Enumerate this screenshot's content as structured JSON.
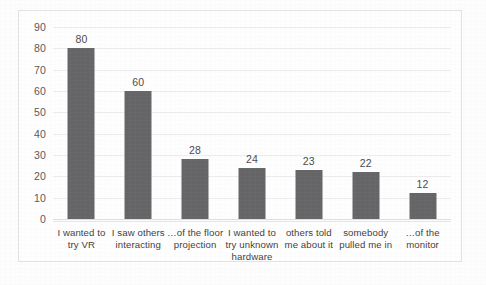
{
  "chart_data": {
    "type": "bar",
    "title": "",
    "xlabel": "",
    "ylabel": "",
    "categories": [
      "I wanted to try VR",
      "I saw others interacting",
      "…of the floor projection",
      "I wanted to try unknown hardware",
      "others told me about it",
      "somebody pulled me in",
      "…of the monitor"
    ],
    "values": [
      80,
      60,
      28,
      24,
      23,
      22,
      12
    ],
    "yticks": [
      0,
      10,
      20,
      30,
      40,
      50,
      60,
      70,
      80,
      90
    ],
    "ylim": [
      0,
      90
    ],
    "grid": true,
    "legend": "none",
    "bar_color": "#656567",
    "gridline_color": "#ededf0",
    "value_labels": [
      "80",
      "60",
      "28",
      "24",
      "23",
      "22",
      "12"
    ],
    "ytick_labels": [
      "0",
      "10",
      "20",
      "30",
      "40",
      "50",
      "60",
      "70",
      "80",
      "90"
    ]
  }
}
